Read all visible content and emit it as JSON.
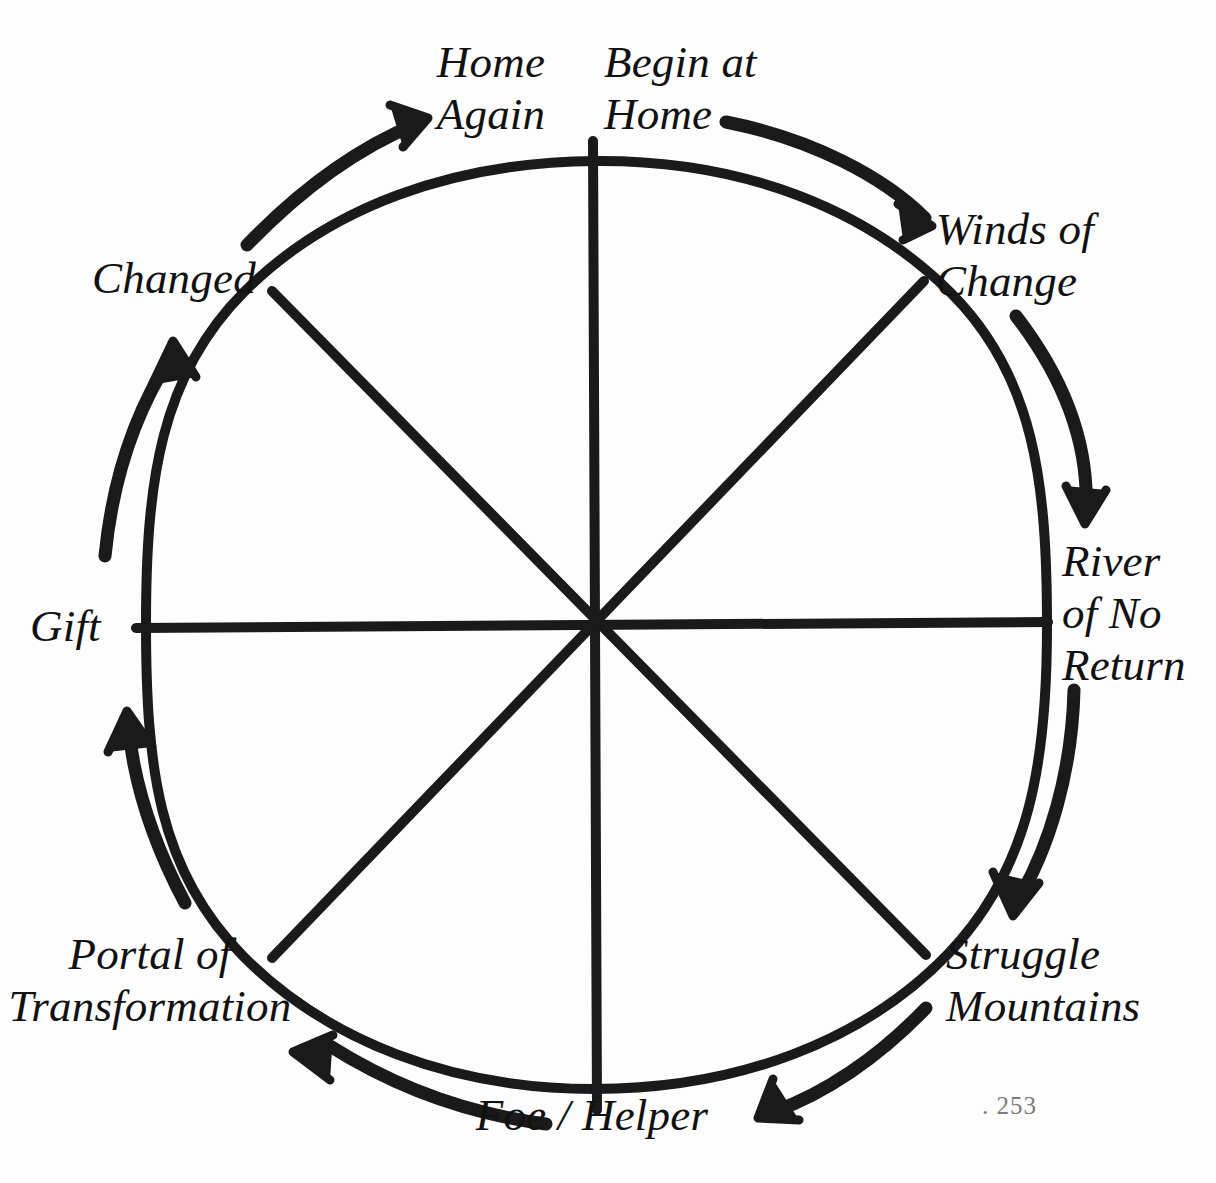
{
  "diagram": {
    "type": "radial-cycle",
    "direction": "clockwise",
    "ink_color": "#1a1a1a",
    "background_color": "#fdfdfd",
    "circle": {
      "center_x": 596,
      "center_y": 625,
      "radius": 452,
      "spokes": 8
    },
    "stages": [
      {
        "id": "begin-at-home",
        "label": "Begin at\nHome",
        "angle_deg": 0,
        "position": "top-right-of-top"
      },
      {
        "id": "winds-of-change",
        "label": "Winds of\nChange",
        "angle_deg": 45,
        "position": "upper-right"
      },
      {
        "id": "river-of-no-return",
        "label": "River\nof No\nReturn",
        "angle_deg": 90,
        "position": "right"
      },
      {
        "id": "struggle-mountains",
        "label": "Struggle\nMountains",
        "angle_deg": 135,
        "position": "lower-right"
      },
      {
        "id": "foe-helper",
        "label": "Foe / Helper",
        "angle_deg": 180,
        "position": "bottom"
      },
      {
        "id": "portal-of-transformation",
        "label": "Portal of\nTransformation",
        "angle_deg": 225,
        "position": "lower-left"
      },
      {
        "id": "gift",
        "label": "Gift",
        "angle_deg": 270,
        "position": "left"
      },
      {
        "id": "changed",
        "label": "Changed",
        "angle_deg": 315,
        "position": "upper-left"
      },
      {
        "id": "home-again",
        "label": "Home\nAgain",
        "angle_deg": 360,
        "position": "top-left-of-top"
      }
    ],
    "arrows": [
      {
        "id": "arrow-top-right",
        "from_stage": "begin-at-home",
        "to_stage": "winds-of-change"
      },
      {
        "id": "arrow-right-upper",
        "from_stage": "winds-of-change",
        "to_stage": "river-of-no-return"
      },
      {
        "id": "arrow-right-lower",
        "from_stage": "river-of-no-return",
        "to_stage": "struggle-mountains"
      },
      {
        "id": "arrow-bottom-right",
        "from_stage": "struggle-mountains",
        "to_stage": "foe-helper"
      },
      {
        "id": "arrow-bottom-left",
        "from_stage": "foe-helper",
        "to_stage": "portal-of-transformation"
      },
      {
        "id": "arrow-left-lower",
        "from_stage": "portal-of-transformation",
        "to_stage": "gift"
      },
      {
        "id": "arrow-left-upper",
        "from_stage": "gift",
        "to_stage": "changed"
      },
      {
        "id": "arrow-top-left",
        "from_stage": "changed",
        "to_stage": "home-again"
      }
    ]
  },
  "page_marker": ". 253"
}
